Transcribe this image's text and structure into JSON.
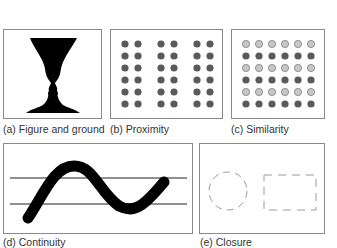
{
  "figure": {
    "panels": [
      {
        "id": "a",
        "caption": "(a) Figure and ground",
        "principle": "Figure and ground",
        "content": "Rubin vase: black vase silhouette forming two facing profiles"
      },
      {
        "id": "b",
        "caption": "(b) Proximity",
        "principle": "Proximity",
        "content": "6 rows x 6 dark gray dots grouped into 3 column pairs"
      },
      {
        "id": "c",
        "caption": "(c) Similarity",
        "principle": "Similarity",
        "content": "6x6 dot grid with alternating rows of light gray and dark gray dots"
      },
      {
        "id": "d",
        "caption": "(d) Continuity",
        "principle": "Continuity",
        "content": "Thick black S-curve crossing two horizontal lines"
      },
      {
        "id": "e",
        "caption": "(e) Closure",
        "principle": "Closure",
        "content": "Dashed incomplete circle and dashed incomplete rectangle"
      }
    ],
    "colors": {
      "border": "#8a8a8a",
      "dark_dot": "#5a5a5a",
      "light_dot": "#c8c8c8",
      "black": "#000000",
      "dashed": "#9a9a9a"
    }
  }
}
